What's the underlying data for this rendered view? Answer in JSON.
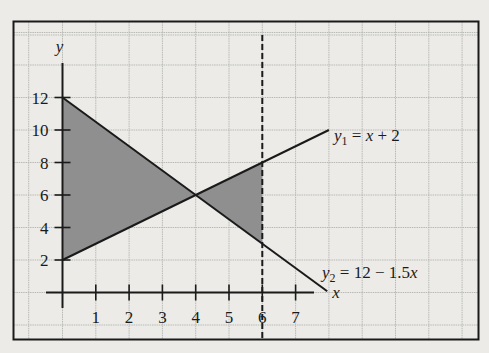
{
  "chart_data": {
    "type": "line",
    "title": "",
    "xlabel": "x",
    "ylabel": "y",
    "xlim": [
      0,
      7
    ],
    "ylim": [
      0,
      12
    ],
    "grid": true,
    "legend_position": "inline labels at right of lines",
    "x_ticks": [
      "1",
      "2",
      "3",
      "4",
      "5",
      "6",
      "7"
    ],
    "y_ticks": [
      "2",
      "4",
      "6",
      "8",
      "10",
      "12"
    ],
    "series": [
      {
        "name": "y1 = x + 2",
        "label_main": "y",
        "label_sub": "1",
        "label_rest": " = x + 2",
        "x": [
          0,
          8
        ],
        "y": [
          2,
          10
        ]
      },
      {
        "name": "y2 = 12 − 1.5x",
        "label_main": "y",
        "label_sub": "2",
        "label_rest": " = 12 − 1.5x",
        "x": [
          0,
          8
        ],
        "y": [
          12,
          0
        ]
      }
    ],
    "vertical_line": {
      "x": 6,
      "style": "dashed"
    },
    "shaded_regions": [
      {
        "description": "between y2 (top) and y1 (bottom) from x=0 to x=4",
        "vertices": [
          [
            0,
            12
          ],
          [
            4,
            6
          ],
          [
            0,
            2
          ]
        ]
      },
      {
        "description": "between y1 (top) and y2 (bottom) from x=4 to x=6",
        "vertices": [
          [
            4,
            6
          ],
          [
            6,
            8
          ],
          [
            6,
            3
          ]
        ]
      }
    ],
    "intersection": {
      "x": 4,
      "y": 6
    }
  },
  "colors": {
    "background": "#ecebe7",
    "grid": "#b9b9b6",
    "ink": "#1a1a1a",
    "shade": "#8f8f8f"
  }
}
